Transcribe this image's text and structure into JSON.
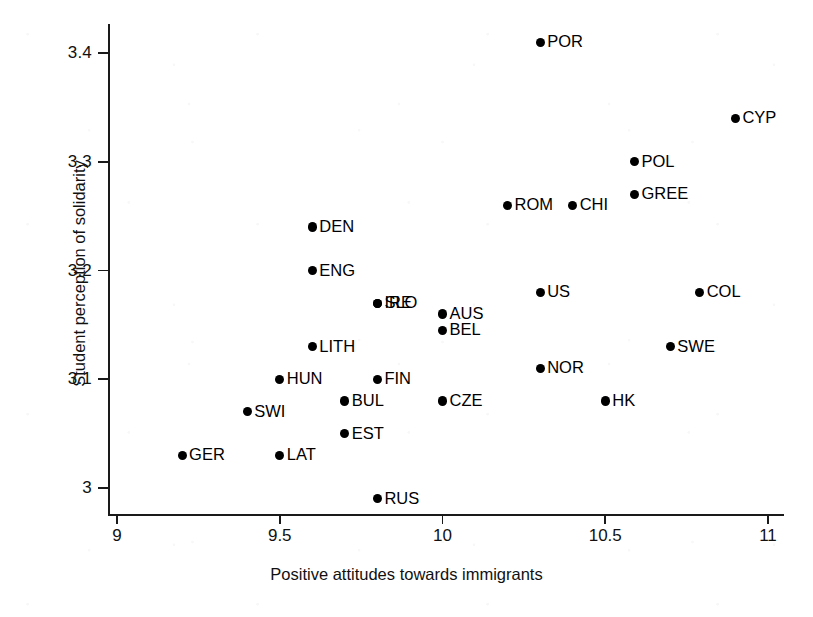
{
  "chart_data": {
    "type": "scatter",
    "title": "",
    "xlabel": "Positive attitudes towards immigrants",
    "ylabel": "Student perception of solidarity",
    "xlim": [
      9,
      11
    ],
    "ylim": [
      3,
      3.45
    ],
    "xticks": [
      "9",
      "9.5",
      "10",
      "10.5",
      "11"
    ],
    "xtick_values": [
      9,
      9.5,
      10,
      10.5,
      11
    ],
    "yticks": [
      "3",
      "3.1",
      "3.2",
      "3.3",
      "3.4"
    ],
    "ytick_values": [
      3,
      3.1,
      3.2,
      3.3,
      3.4
    ],
    "grid": false,
    "legend": false,
    "marker": "filled-circle",
    "marker_color": "#000000",
    "label_position": "right-of-marker",
    "points": [
      {
        "label": "POR",
        "x": 10.3,
        "y": 3.41
      },
      {
        "label": "CYP",
        "x": 10.9,
        "y": 3.34
      },
      {
        "label": "POL",
        "x": 10.59,
        "y": 3.3
      },
      {
        "label": "GREE",
        "x": 10.59,
        "y": 3.27
      },
      {
        "label": "ROM",
        "x": 10.2,
        "y": 3.26
      },
      {
        "label": "CHI",
        "x": 10.4,
        "y": 3.26
      },
      {
        "label": "DEN",
        "x": 9.6,
        "y": 3.24
      },
      {
        "label": "ENG",
        "x": 9.6,
        "y": 3.2
      },
      {
        "label": "US",
        "x": 10.3,
        "y": 3.18
      },
      {
        "label": "COL",
        "x": 10.79,
        "y": 3.18
      },
      {
        "label": "SLO",
        "x": 9.8,
        "y": 3.17
      },
      {
        "label": "IRE",
        "x": 9.8,
        "y": 3.17
      },
      {
        "label": "AUS",
        "x": 10.0,
        "y": 3.16
      },
      {
        "label": "BEL",
        "x": 10.0,
        "y": 3.145
      },
      {
        "label": "LITH",
        "x": 9.6,
        "y": 3.13
      },
      {
        "label": "SWE",
        "x": 10.7,
        "y": 3.13
      },
      {
        "label": "NOR",
        "x": 10.3,
        "y": 3.11
      },
      {
        "label": "HUN",
        "x": 9.5,
        "y": 3.1
      },
      {
        "label": "FIN",
        "x": 9.8,
        "y": 3.1
      },
      {
        "label": "BUL",
        "x": 9.7,
        "y": 3.08
      },
      {
        "label": "CZE",
        "x": 10.0,
        "y": 3.08
      },
      {
        "label": "HK",
        "x": 10.5,
        "y": 3.08
      },
      {
        "label": "SWI",
        "x": 9.4,
        "y": 3.07
      },
      {
        "label": "EST",
        "x": 9.7,
        "y": 3.05
      },
      {
        "label": "GER",
        "x": 9.2,
        "y": 3.03
      },
      {
        "label": "LAT",
        "x": 9.5,
        "y": 3.03
      },
      {
        "label": "RUS",
        "x": 9.8,
        "y": 2.99
      }
    ]
  }
}
